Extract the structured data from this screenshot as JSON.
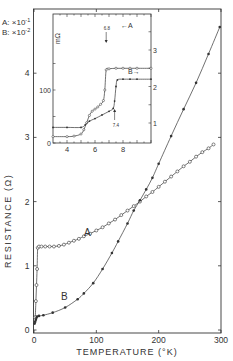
{
  "chart_data": [
    {
      "type": "line",
      "title": "",
      "xlabel": "TEMPERATURE (°K)",
      "ylabel": "RESISTANCE (Ω)",
      "xlim": [
        0,
        300
      ],
      "ylim": [
        0,
        4.7
      ],
      "x_ticks": [
        0,
        100,
        200,
        300
      ],
      "y_ticks": [
        0,
        1,
        2,
        3,
        4
      ],
      "grid": false,
      "scale_note": [
        "A: ×10⁻¹",
        "B: ×10⁻²"
      ],
      "series": [
        {
          "name": "A",
          "marker": "open-circle",
          "points": [
            [
              2,
              0.2
            ],
            [
              3,
              0.45
            ],
            [
              4,
              0.7
            ],
            [
              5,
              0.95
            ],
            [
              6,
              1.28
            ],
            [
              8,
              1.3
            ],
            [
              12,
              1.3
            ],
            [
              18,
              1.3
            ],
            [
              25,
              1.3
            ],
            [
              32,
              1.3
            ],
            [
              40,
              1.31
            ],
            [
              48,
              1.33
            ],
            [
              56,
              1.36
            ],
            [
              64,
              1.39
            ],
            [
              72,
              1.42
            ],
            [
              80,
              1.46
            ],
            [
              90,
              1.5
            ],
            [
              100,
              1.55
            ],
            [
              110,
              1.6
            ],
            [
              120,
              1.66
            ],
            [
              130,
              1.72
            ],
            [
              140,
              1.79
            ],
            [
              150,
              1.86
            ],
            [
              160,
              1.93
            ],
            [
              170,
              2.0
            ],
            [
              180,
              2.08
            ],
            [
              190,
              2.15
            ],
            [
              200,
              2.23
            ],
            [
              210,
              2.31
            ],
            [
              220,
              2.39
            ],
            [
              230,
              2.47
            ],
            [
              240,
              2.55
            ],
            [
              250,
              2.62
            ],
            [
              260,
              2.7
            ],
            [
              270,
              2.77
            ],
            [
              280,
              2.83
            ],
            [
              288,
              2.89
            ]
          ]
        },
        {
          "name": "B",
          "marker": "filled-circle",
          "points": [
            [
              1,
              0.1
            ],
            [
              2,
              0.13
            ],
            [
              3,
              0.16
            ],
            [
              4,
              0.19
            ],
            [
              5,
              0.21
            ],
            [
              8,
              0.22
            ],
            [
              15,
              0.23
            ],
            [
              30,
              0.27
            ],
            [
              50,
              0.35
            ],
            [
              70,
              0.48
            ],
            [
              80,
              0.57
            ],
            [
              95,
              0.73
            ],
            [
              110,
              0.95
            ],
            [
              125,
              1.2
            ],
            [
              135,
              1.38
            ],
            [
              150,
              1.66
            ],
            [
              160,
              1.86
            ],
            [
              170,
              2.02
            ],
            [
              180,
              2.19
            ],
            [
              190,
              2.37
            ],
            [
              200,
              2.59
            ],
            [
              220,
              3.02
            ],
            [
              240,
              3.44
            ],
            [
              260,
              3.85
            ],
            [
              280,
              4.3
            ],
            [
              298,
              4.72
            ]
          ]
        }
      ],
      "annotations": [
        "A",
        "B"
      ]
    },
    {
      "type": "line",
      "title": "inset",
      "xlabel": "",
      "ylabel": "m Ω",
      "xlim": [
        3,
        10
      ],
      "ylim_left": [
        0,
        160
      ],
      "ylim_right": [
        0.5,
        3.5
      ],
      "x_ticks": [
        4,
        6,
        8
      ],
      "y_ticks_left": [
        0,
        100
      ],
      "y_ticks_right": [
        1,
        2,
        3
      ],
      "series": [
        {
          "name": "A",
          "axis": "left",
          "marker": "open-circle",
          "points": [
            [
              3,
              12
            ],
            [
              4,
              12
            ],
            [
              4.5,
              13
            ],
            [
              5,
              17
            ],
            [
              5.2,
              25
            ],
            [
              5.4,
              38
            ],
            [
              5.6,
              52
            ],
            [
              5.8,
              60
            ],
            [
              6,
              64
            ],
            [
              6.2,
              68
            ],
            [
              6.4,
              73
            ],
            [
              6.6,
              80
            ],
            [
              6.7,
              100
            ],
            [
              6.8,
              138
            ],
            [
              7,
              140
            ],
            [
              7.5,
              141
            ],
            [
              8,
              141
            ],
            [
              8.5,
              141
            ],
            [
              9,
              141
            ],
            [
              10,
              141
            ]
          ]
        },
        {
          "name": "B",
          "axis": "right",
          "marker": "filled-circle",
          "points": [
            [
              3,
              0.88
            ],
            [
              4,
              0.88
            ],
            [
              5,
              0.88
            ],
            [
              5.3,
              0.95
            ],
            [
              5.6,
              1.05
            ],
            [
              6,
              1.12
            ],
            [
              6.5,
              1.22
            ],
            [
              7,
              1.32
            ],
            [
              7.3,
              1.4
            ],
            [
              7.4,
              1.6
            ],
            [
              7.5,
              2.0
            ],
            [
              7.6,
              2.18
            ],
            [
              8,
              2.2
            ],
            [
              8.5,
              2.2
            ],
            [
              9,
              2.2
            ],
            [
              10,
              2.2
            ]
          ]
        }
      ],
      "annotations": [
        {
          "text": "6.8",
          "x": 6.8,
          "note": "arrow marking transition of A"
        },
        {
          "text": "7.4",
          "x": 7.4,
          "note": "arrow marking transition of B"
        },
        {
          "text": "←A",
          "note": "A reads left axis"
        },
        {
          "text": "B→",
          "note": "B reads right axis"
        }
      ]
    }
  ],
  "labels": {
    "scale_a": "A: ×10",
    "scale_a_exp": "-1",
    "scale_b": "B: ×10",
    "scale_b_exp": "-2",
    "ylabel": "RESISTANCE  (Ω)",
    "xlabel": "TEMPERATURE (°K)",
    "curve_a": "A",
    "curve_b": "B",
    "inset_ylabel": "mΩ",
    "inset_arrow_a": "←A",
    "inset_arrow_b": "B→",
    "inset_ann_a": "6.8",
    "inset_ann_b": "7.4"
  },
  "colors": {
    "ink": "#333333",
    "background": "#ffffff"
  }
}
